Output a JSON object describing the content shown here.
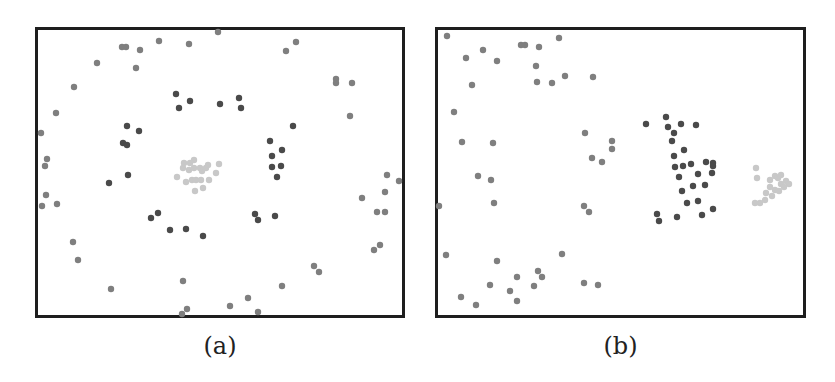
{
  "chart_data": [
    {
      "type": "scatter",
      "title": "",
      "caption": "(a)",
      "xlabel": "",
      "ylabel": "",
      "grid": false,
      "legend": null,
      "frame_px": {
        "left": 35,
        "top": 27,
        "right": 405,
        "bottom": 318
      },
      "coordinate_note": "Point coordinates in screenshot pixel units (x right, y down); no axis ticks shown",
      "series": [
        {
          "name": "outer",
          "color": "#7f7f7f",
          "points": [
            [
              218,
              32
            ],
            [
              122,
              47
            ],
            [
              126,
              47
            ],
            [
              140,
              50
            ],
            [
              159,
              41
            ],
            [
              189,
              44
            ],
            [
              97,
              63
            ],
            [
              136,
              68
            ],
            [
              286,
              51
            ],
            [
              296,
              42
            ],
            [
              74,
              87
            ],
            [
              56,
              113
            ],
            [
              41,
              133
            ],
            [
              47,
              159
            ],
            [
              45,
              166
            ],
            [
              46,
              195
            ],
            [
              42,
              206
            ],
            [
              57,
              204
            ],
            [
              73,
              242
            ],
            [
              78,
              260
            ],
            [
              111,
              289
            ],
            [
              336,
              79
            ],
            [
              336,
              83
            ],
            [
              352,
              83
            ],
            [
              350,
              116
            ],
            [
              387,
              175
            ],
            [
              399,
              181
            ],
            [
              362,
              198
            ],
            [
              385,
              192
            ],
            [
              377,
              212
            ],
            [
              385,
              212
            ],
            [
              380,
              245
            ],
            [
              374,
              250
            ],
            [
              314,
              266
            ],
            [
              319,
              272
            ],
            [
              282,
              286
            ],
            [
              248,
              298
            ],
            [
              230,
              306
            ],
            [
              258,
              312
            ],
            [
              183,
              281
            ],
            [
              187,
              309
            ],
            [
              182,
              314
            ]
          ]
        },
        {
          "name": "inner-ring",
          "color": "#4a4a4a",
          "points": [
            [
              176,
              94
            ],
            [
              190,
              101
            ],
            [
              179,
              108
            ],
            [
              220,
              104
            ],
            [
              239,
              98
            ],
            [
              241,
              108
            ],
            [
              293,
              126
            ],
            [
              127,
              126
            ],
            [
              139,
              131
            ],
            [
              123,
              143
            ],
            [
              127,
              145
            ],
            [
              109,
              183
            ],
            [
              128,
              175
            ],
            [
              270,
              141
            ],
            [
              282,
              150
            ],
            [
              272,
              156
            ],
            [
              272,
              167
            ],
            [
              281,
              166
            ],
            [
              277,
              177
            ],
            [
              151,
              218
            ],
            [
              158,
              213
            ],
            [
              170,
              230
            ],
            [
              186,
              229
            ],
            [
              203,
              236
            ],
            [
              255,
              214
            ],
            [
              258,
              220
            ],
            [
              275,
              216
            ]
          ]
        },
        {
          "name": "center",
          "color": "#c8c8c8",
          "points": [
            [
              184,
              163
            ],
            [
              194,
              160
            ],
            [
              189,
              170
            ],
            [
              194,
              168
            ],
            [
              200,
              168
            ],
            [
              202,
              171
            ],
            [
              206,
              168
            ],
            [
              208,
              165
            ],
            [
              219,
              164
            ],
            [
              177,
              177
            ],
            [
              186,
              182
            ],
            [
              192,
              180
            ],
            [
              196,
              180
            ],
            [
              201,
              180
            ],
            [
              209,
              180
            ],
            [
              216,
              173
            ],
            [
              195,
              191
            ],
            [
              203,
              188
            ],
            [
              183,
              168
            ],
            [
              190,
              163
            ]
          ]
        }
      ]
    },
    {
      "type": "scatter",
      "title": "",
      "caption": "(b)",
      "xlabel": "",
      "ylabel": "",
      "grid": false,
      "legend": null,
      "frame_px": {
        "left": 435,
        "top": 27,
        "right": 806,
        "bottom": 318
      },
      "coordinate_note": "Point coordinates in screenshot pixel units (x right, y down); no axis ticks shown",
      "series": [
        {
          "name": "outer",
          "color": "#7f7f7f",
          "points": [
            [
              447,
              36
            ],
            [
              466,
              58
            ],
            [
              483,
              50
            ],
            [
              497,
              61
            ],
            [
              521,
              45
            ],
            [
              525,
              45
            ],
            [
              539,
              47
            ],
            [
              559,
              38
            ],
            [
              536,
              66
            ],
            [
              537,
              82
            ],
            [
              552,
              83
            ],
            [
              565,
              76
            ],
            [
              593,
              77
            ],
            [
              472,
              85
            ],
            [
              454,
              112
            ],
            [
              462,
              142
            ],
            [
              493,
              143
            ],
            [
              478,
              176
            ],
            [
              491,
              180
            ],
            [
              494,
              203
            ],
            [
              439,
              206
            ],
            [
              585,
              133
            ],
            [
              612,
              141
            ],
            [
              612,
              149
            ],
            [
              592,
              158
            ],
            [
              602,
              162
            ],
            [
              584,
              206
            ],
            [
              589,
              212
            ],
            [
              446,
              255
            ],
            [
              497,
              261
            ],
            [
              562,
              254
            ],
            [
              538,
              271
            ],
            [
              542,
              277
            ],
            [
              517,
              277
            ],
            [
              490,
              285
            ],
            [
              534,
              286
            ],
            [
              510,
              291
            ],
            [
              461,
              297
            ],
            [
              476,
              305
            ],
            [
              517,
              301
            ],
            [
              584,
              283
            ],
            [
              598,
              285
            ]
          ]
        },
        {
          "name": "middle-cluster",
          "color": "#4a4a4a",
          "points": [
            [
              646,
              124
            ],
            [
              666,
              117
            ],
            [
              668,
              127
            ],
            [
              681,
              124
            ],
            [
              696,
              125
            ],
            [
              674,
              133
            ],
            [
              672,
              141
            ],
            [
              684,
              150
            ],
            [
              674,
              156
            ],
            [
              675,
              167
            ],
            [
              683,
              166
            ],
            [
              691,
              164
            ],
            [
              706,
              162
            ],
            [
              713,
              163
            ],
            [
              712,
              173
            ],
            [
              698,
              174
            ],
            [
              679,
              177
            ],
            [
              713,
              166
            ],
            [
              693,
              186
            ],
            [
              705,
              185
            ],
            [
              682,
              191
            ],
            [
              698,
              201
            ],
            [
              713,
              209
            ],
            [
              687,
              203
            ],
            [
              657,
              214
            ],
            [
              659,
              221
            ],
            [
              677,
              217
            ],
            [
              702,
              215
            ]
          ]
        },
        {
          "name": "right-cluster",
          "color": "#c8c8c8",
          "points": [
            [
              756,
              168
            ],
            [
              757,
              178
            ],
            [
              770,
              180
            ],
            [
              775,
              176
            ],
            [
              778,
              178
            ],
            [
              781,
              184
            ],
            [
              786,
              181
            ],
            [
              789,
              184
            ],
            [
              775,
              190
            ],
            [
              770,
              187
            ],
            [
              766,
              193
            ],
            [
              772,
              196
            ],
            [
              779,
              191
            ],
            [
              765,
              200
            ],
            [
              760,
              203
            ],
            [
              755,
              203
            ],
            [
              784,
              187
            ],
            [
              781,
              175
            ]
          ]
        }
      ]
    }
  ]
}
